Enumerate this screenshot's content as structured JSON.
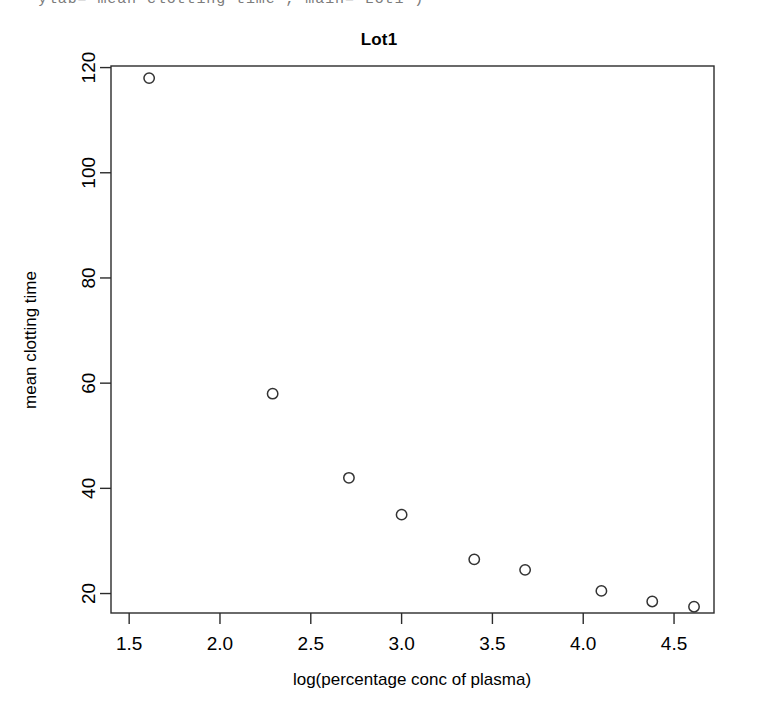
{
  "console": {
    "code_line": "ylab=\"mean clotting time\", main=\"Lot1\")"
  },
  "chart_data": {
    "type": "scatter",
    "title": "Lot1",
    "xlabel": "log(percentage conc of plasma)",
    "ylabel": "mean clotting time",
    "xlim": [
      1.4,
      4.72
    ],
    "ylim": [
      16.3,
      120.3
    ],
    "xticks": [
      1.5,
      2.0,
      2.5,
      3.0,
      3.5,
      4.0,
      4.5
    ],
    "xticklabels": [
      "1.5",
      "2.0",
      "2.5",
      "3.0",
      "3.5",
      "4.0",
      "4.5"
    ],
    "yticks": [
      20,
      40,
      60,
      80,
      100,
      120
    ],
    "yticklabels": [
      "20",
      "40",
      "60",
      "80",
      "100",
      "120"
    ],
    "grid": false,
    "legend": null,
    "marker": "open-circle",
    "marker_color": "#333333",
    "x": [
      1.61,
      2.29,
      2.71,
      3.0,
      3.4,
      3.68,
      4.1,
      4.38,
      4.61
    ],
    "y": [
      118,
      58,
      42,
      35,
      26.5,
      24.5,
      20.5,
      18.5,
      17.5
    ],
    "points": [
      {
        "x": 1.61,
        "y": 118
      },
      {
        "x": 2.29,
        "y": 58
      },
      {
        "x": 2.71,
        "y": 42
      },
      {
        "x": 3.0,
        "y": 35
      },
      {
        "x": 3.4,
        "y": 26.5
      },
      {
        "x": 3.68,
        "y": 24.5
      },
      {
        "x": 4.1,
        "y": 20.5
      },
      {
        "x": 4.38,
        "y": 18.5
      },
      {
        "x": 4.61,
        "y": 17.5
      }
    ]
  }
}
